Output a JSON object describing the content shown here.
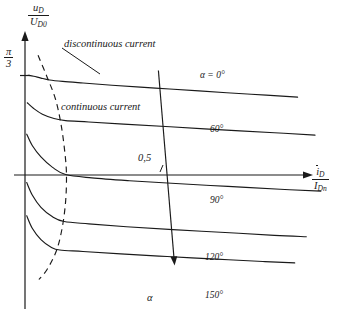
{
  "figure": {
    "axes": {
      "y_label_numerator": "u",
      "y_label_numerator_sub": "D",
      "y_label_denominator": "U",
      "y_label_denominator_sub": "D0",
      "y_tick_label_numerator": "π",
      "y_tick_label_denominator": "3",
      "x_label_numerator": "i",
      "x_label_numerator_sub": "D",
      "x_label_denominator": "I",
      "x_label_denominator_sub": "Dn"
    },
    "annotations": {
      "discontinuous": "discontinuous current",
      "continuous": "continuous current",
      "midpoint_value": "0,5",
      "alpha_axis": "α"
    },
    "curve_labels": {
      "first": "α = 0°",
      "second": "60°",
      "third": "90°",
      "fourth": "120°",
      "fifth": "150°"
    },
    "colors": {
      "ink": "#1a1a1a",
      "background": "#ffffff"
    }
  },
  "chart_data": {
    "type": "line",
    "xlabel": "ī_D / I_Dn",
    "ylabel": "u_D / U_D0",
    "grid": false,
    "legend_position": "inline-right-of-each-curve",
    "y_axis_ticks": [
      {
        "label": "π/3",
        "value": 1.0471975512
      }
    ],
    "annotations": [
      {
        "text": "discontinuous current",
        "x": 0.22,
        "y": 1.18,
        "leader_to": {
          "x": 0.1,
          "y": 0.88
        }
      },
      {
        "text": "continuous current",
        "x": 0.21,
        "y": 0.72
      },
      {
        "text": "0,5",
        "x": 0.5,
        "y": 0.1,
        "note": "marks the i_D/I_Dn = 0,5 location on the horizontal axis"
      },
      {
        "text": "α",
        "x": 0.5,
        "y": -0.95,
        "note": "arrowhead of the oblique firing-angle axis"
      }
    ],
    "oblique_alpha_axis": {
      "description": "Slanted axis of increasing firing angle alpha, crossing all five characteristics",
      "start": {
        "x": 0.46,
        "y": 1.1
      },
      "end": {
        "x": 0.515,
        "y": -0.92
      },
      "arrow": "end"
    },
    "boundary_curve": {
      "name": "discontinuous / continuous current boundary",
      "style": "dashed",
      "points": [
        {
          "x": 0.045,
          "y": 1.26
        },
        {
          "x": 0.075,
          "y": 1.04
        },
        {
          "x": 0.105,
          "y": 0.8
        },
        {
          "x": 0.125,
          "y": 0.52
        },
        {
          "x": 0.138,
          "y": 0.22
        },
        {
          "x": 0.143,
          "y": 0.0
        },
        {
          "x": 0.14,
          "y": -0.28
        },
        {
          "x": 0.128,
          "y": -0.56
        },
        {
          "x": 0.108,
          "y": -0.8
        },
        {
          "x": 0.075,
          "y": -1.0
        },
        {
          "x": 0.048,
          "y": -1.1
        }
      ]
    },
    "series": [
      {
        "name": "α = 0°",
        "alpha_deg": 0,
        "label_at": {
          "x": 0.6,
          "y": 1.02
        },
        "points": [
          {
            "x": 0.01,
            "y": 1.05
          },
          {
            "x": 0.03,
            "y": 1.04
          },
          {
            "x": 0.055,
            "y": 1.02
          },
          {
            "x": 0.085,
            "y": 1.0
          },
          {
            "x": 0.13,
            "y": 0.985
          },
          {
            "x": 0.2,
            "y": 0.968
          },
          {
            "x": 0.3,
            "y": 0.945
          },
          {
            "x": 0.45,
            "y": 0.915
          },
          {
            "x": 0.6,
            "y": 0.885
          },
          {
            "x": 0.78,
            "y": 0.85
          },
          {
            "x": 0.94,
            "y": 0.82
          }
        ]
      },
      {
        "name": "60°",
        "alpha_deg": 60,
        "label_at": {
          "x": 0.62,
          "y": 0.56
        },
        "points": [
          {
            "x": 0.008,
            "y": 0.76
          },
          {
            "x": 0.03,
            "y": 0.7
          },
          {
            "x": 0.06,
            "y": 0.64
          },
          {
            "x": 0.1,
            "y": 0.595
          },
          {
            "x": 0.14,
            "y": 0.572
          },
          {
            "x": 0.22,
            "y": 0.558
          },
          {
            "x": 0.34,
            "y": 0.535
          },
          {
            "x": 0.5,
            "y": 0.508
          },
          {
            "x": 0.68,
            "y": 0.475
          },
          {
            "x": 0.86,
            "y": 0.445
          },
          {
            "x": 1.0,
            "y": 0.42
          }
        ]
      },
      {
        "name": "90°",
        "alpha_deg": 90,
        "label_at": {
          "x": 0.62,
          "y": -0.14
        },
        "points": [
          {
            "x": 0.006,
            "y": 0.43
          },
          {
            "x": 0.025,
            "y": 0.31
          },
          {
            "x": 0.055,
            "y": 0.19
          },
          {
            "x": 0.095,
            "y": 0.08
          },
          {
            "x": 0.14,
            "y": 0.005
          },
          {
            "x": 0.23,
            "y": -0.03
          },
          {
            "x": 0.36,
            "y": -0.06
          },
          {
            "x": 0.52,
            "y": -0.09
          },
          {
            "x": 0.7,
            "y": -0.12
          },
          {
            "x": 0.88,
            "y": -0.15
          },
          {
            "x": 1.02,
            "y": -0.17
          }
        ]
      },
      {
        "name": "120°",
        "alpha_deg": 120,
        "label_at": {
          "x": 0.6,
          "y": -0.7
        },
        "points": [
          {
            "x": 0.006,
            "y": -0.08
          },
          {
            "x": 0.025,
            "y": -0.21
          },
          {
            "x": 0.055,
            "y": -0.34
          },
          {
            "x": 0.095,
            "y": -0.44
          },
          {
            "x": 0.135,
            "y": -0.49
          },
          {
            "x": 0.22,
            "y": -0.515
          },
          {
            "x": 0.35,
            "y": -0.545
          },
          {
            "x": 0.51,
            "y": -0.575
          },
          {
            "x": 0.69,
            "y": -0.605
          },
          {
            "x": 0.86,
            "y": -0.635
          },
          {
            "x": 0.97,
            "y": -0.65
          }
        ]
      },
      {
        "name": "150°",
        "alpha_deg": 150,
        "label_at": {
          "x": 0.6,
          "y": -1.0
        },
        "points": [
          {
            "x": 0.006,
            "y": -0.43
          },
          {
            "x": 0.025,
            "y": -0.56
          },
          {
            "x": 0.055,
            "y": -0.68
          },
          {
            "x": 0.09,
            "y": -0.76
          },
          {
            "x": 0.12,
            "y": -0.79
          },
          {
            "x": 0.2,
            "y": -0.805
          },
          {
            "x": 0.33,
            "y": -0.83
          },
          {
            "x": 0.49,
            "y": -0.858
          },
          {
            "x": 0.66,
            "y": -0.885
          },
          {
            "x": 0.82,
            "y": -0.91
          },
          {
            "x": 0.93,
            "y": -0.925
          }
        ]
      }
    ]
  }
}
